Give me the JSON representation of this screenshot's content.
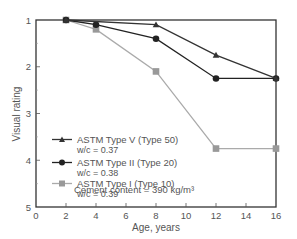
{
  "chart_data": {
    "type": "line",
    "title": "",
    "xlabel": "Age, years",
    "ylabel": "Visual rating",
    "xlim": [
      0,
      16
    ],
    "ylim": [
      1,
      5
    ],
    "y_inverted": true,
    "x_ticks": [
      0,
      2,
      4,
      6,
      8,
      10,
      12,
      14,
      16
    ],
    "y_ticks": [
      1,
      2,
      3,
      4,
      5
    ],
    "grid": false,
    "legend_position": "lower-left inside",
    "series": [
      {
        "name": "ASTM Type V (Type 50)",
        "sub": "w/c = 0.37",
        "marker": "triangle",
        "color": "#333333",
        "x": [
          2,
          8,
          12,
          16
        ],
        "y": [
          1.0,
          1.1,
          1.75,
          2.25
        ]
      },
      {
        "name": "ASTM Type II (Type 20)",
        "sub": "w/c = 0.38",
        "marker": "circle",
        "color": "#222222",
        "x": [
          2,
          4,
          8,
          12,
          16
        ],
        "y": [
          1.0,
          1.1,
          1.4,
          2.25,
          2.25
        ]
      },
      {
        "name": "ASTM Type I (Type 10)",
        "sub": "w/c = 0.39",
        "marker": "square",
        "color": "#aaaaaa",
        "x": [
          2,
          4,
          8,
          12,
          16
        ],
        "y": [
          1.0,
          1.2,
          2.1,
          3.75,
          3.75
        ]
      }
    ],
    "annotations": [
      "Cement content = 390 kg/m³"
    ]
  }
}
